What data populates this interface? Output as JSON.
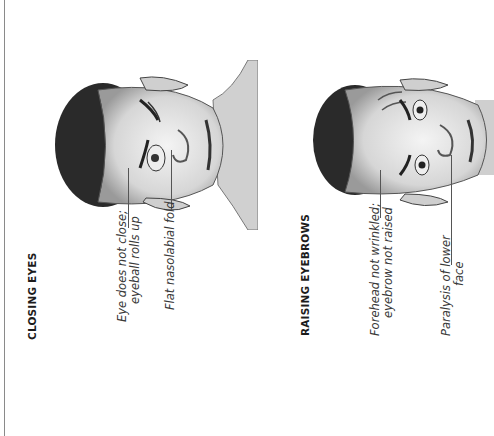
{
  "page": {
    "orientation": "rotated-90-ccw",
    "sections": [
      {
        "heading": "CLOSING EYES",
        "labels": [
          {
            "line1": "Eye does not close;",
            "line2": "eyeball rolls up"
          },
          {
            "line1": "Flat nasolabial fold",
            "line2": ""
          }
        ]
      },
      {
        "heading": "RAISING EYEBROWS",
        "labels": [
          {
            "line1": "Forehead not wrinkled;",
            "line2": "eyebrow not raised"
          },
          {
            "line1": "Paralysis of lower",
            "line2": "face"
          }
        ]
      }
    ]
  }
}
